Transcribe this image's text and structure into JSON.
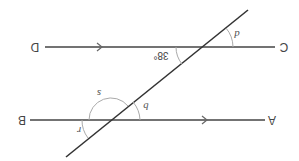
{
  "diagram": {
    "orientation": "rotated 180 degrees (text appears upside down)",
    "colors": {
      "line": "#444444",
      "arc": "#aaaaaa",
      "text": "#444444",
      "background": "#ffffff"
    },
    "points": {
      "top_left": "D",
      "top_right": "C",
      "bottom_left": "B",
      "bottom_right": "A"
    },
    "lines": [
      {
        "name": "DC",
        "parallel_arrow": true
      },
      {
        "name": "BA",
        "parallel_arrow": true
      },
      {
        "name": "transversal",
        "parallel_arrow": false
      }
    ],
    "angles": {
      "given": "38°",
      "d": "d",
      "s": "s",
      "b": "b",
      "r": "r"
    }
  }
}
